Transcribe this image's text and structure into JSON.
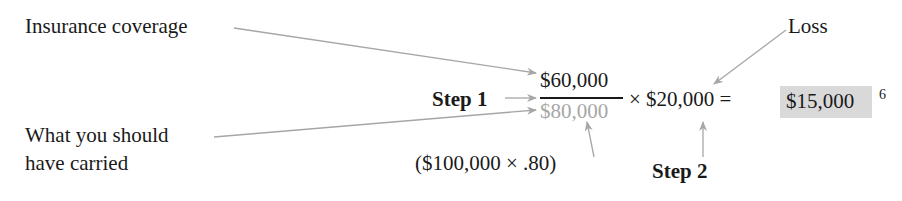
{
  "labels": {
    "insurance_coverage": "Insurance coverage",
    "loss": "Loss",
    "what_you_should": "What you should",
    "have_carried": "have carried",
    "step1": "Step 1",
    "step2": "Step 2"
  },
  "formula": {
    "numerator": "$60,000",
    "denominator": "$80,000",
    "times": "× $20,000 =",
    "result": "$15,000",
    "footnote": "6",
    "denominator_calc": "($100,000 × .80)"
  },
  "colors": {
    "text": "#1a1a1a",
    "arrow": "#a6a6a6",
    "denominator": "#a6a6a6",
    "result_highlight": "#d9d9d9"
  }
}
